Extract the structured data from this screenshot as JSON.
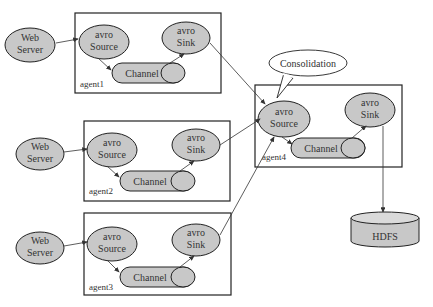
{
  "diagram": {
    "type": "flume-consolidation-topology",
    "callout": {
      "label": "Consolidation"
    },
    "agents": [
      {
        "id": "agent1",
        "label": "agent1",
        "web_server": [
          "Web",
          "Server"
        ],
        "source": [
          "avro",
          "Source"
        ],
        "channel": "Channel",
        "sink": [
          "avro",
          "Sink"
        ]
      },
      {
        "id": "agent2",
        "label": "agent2",
        "web_server": [
          "Web",
          "Server"
        ],
        "source": [
          "avro",
          "Source"
        ],
        "channel": "Channel",
        "sink": [
          "avro",
          "Sink"
        ]
      },
      {
        "id": "agent3",
        "label": "agent3",
        "web_server": [
          "Web",
          "Server"
        ],
        "source": [
          "avro",
          "Source"
        ],
        "channel": "Channel",
        "sink": [
          "avro",
          "Sink"
        ]
      },
      {
        "id": "agent4",
        "label": "agent4",
        "source": [
          "avro",
          "Source"
        ],
        "channel": "Channel",
        "sink": [
          "avro",
          "Sink"
        ]
      }
    ],
    "storage": {
      "label": "HDFS"
    },
    "edges": [
      "Web Server -> agent1 avro Source",
      "agent1 avro Source -> Channel",
      "agent1 Channel -> avro Sink",
      "Web Server -> agent2 avro Source",
      "agent2 avro Source -> Channel",
      "agent2 Channel -> avro Sink",
      "Web Server -> agent3 avro Source",
      "agent3 avro Source -> Channel",
      "agent3 Channel -> avro Sink",
      "agent1 avro Sink -> agent4 avro Source",
      "agent2 avro Sink -> agent4 avro Source",
      "agent3 avro Sink -> agent4 avro Source",
      "agent4 avro Source -> Channel",
      "agent4 Channel -> avro Sink",
      "agent4 avro Sink -> HDFS"
    ]
  }
}
